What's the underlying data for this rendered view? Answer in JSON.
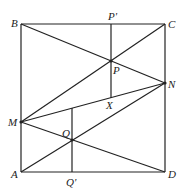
{
  "diagram": {
    "type": "geometry",
    "points": {
      "A": {
        "label": "A",
        "x": 21,
        "y": 172
      },
      "B": {
        "label": "B",
        "x": 21,
        "y": 24
      },
      "C": {
        "label": "C",
        "x": 165,
        "y": 24
      },
      "D": {
        "label": "D",
        "x": 165,
        "y": 172
      },
      "M": {
        "label": "M",
        "x": 21,
        "y": 122
      },
      "N": {
        "label": "N",
        "x": 165,
        "y": 83
      },
      "P": {
        "label": "P",
        "x": 111,
        "y": 61
      },
      "P_prime": {
        "label": "P'",
        "x": 111,
        "y": 24
      },
      "X": {
        "label": "X",
        "x": 111,
        "y": 98
      },
      "Q": {
        "label": "Q",
        "x": 72,
        "y": 140
      },
      "Q_prime": {
        "label": "Q'",
        "x": 72,
        "y": 172
      }
    },
    "segments": [
      "AB",
      "BC",
      "CD",
      "DA",
      "BN",
      "MC",
      "MN",
      "MD",
      "AN",
      "P'X",
      "Q'Q-extended"
    ]
  }
}
